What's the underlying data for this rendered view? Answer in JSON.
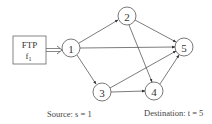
{
  "diagram": {
    "source_box": {
      "line1": "FTP",
      "line2": "f",
      "subscript": "1"
    },
    "nodes": [
      {
        "id": "1",
        "label": "1",
        "x": 71,
        "y": 48
      },
      {
        "id": "2",
        "label": "2",
        "x": 127,
        "y": 16
      },
      {
        "id": "3",
        "label": "3",
        "x": 102,
        "y": 92
      },
      {
        "id": "4",
        "label": "4",
        "x": 154,
        "y": 91
      },
      {
        "id": "5",
        "label": "5",
        "x": 184,
        "y": 47
      }
    ],
    "edges": [
      {
        "from": "1",
        "to": "2"
      },
      {
        "from": "1",
        "to": "5"
      },
      {
        "from": "1",
        "to": "3"
      },
      {
        "from": "2",
        "to": "5"
      },
      {
        "from": "2",
        "to": "4"
      },
      {
        "from": "3",
        "to": "5"
      },
      {
        "from": "3",
        "to": "4"
      },
      {
        "from": "4",
        "to": "5"
      }
    ],
    "captions": {
      "source": "Source: s = 1",
      "destination": "Destination: t = 5"
    }
  }
}
